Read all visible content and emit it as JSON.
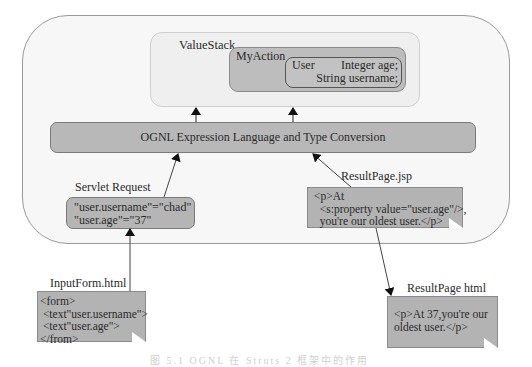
{
  "diagram": {
    "value_stack": {
      "label": "ValueStack",
      "my_action": {
        "label": "MyAction",
        "user": {
          "label": "User",
          "fields": [
            "Integer age;",
            "String username;"
          ]
        }
      }
    },
    "ognl_bar": {
      "label": "OGNL Expression Language and Type Conversion"
    },
    "servlet_request": {
      "label": "Servlet Request",
      "lines": [
        "\"user.username\"=\"chad\"",
        "\"user.age\"=\"37\""
      ]
    },
    "result_page_jsp": {
      "label": "ResultPage.jsp",
      "lines": [
        "<p>At",
        "  <s:property value=\"user.age\"/>,",
        "  you're our oldest user.</p>"
      ]
    },
    "input_form": {
      "label": "InputForm.html",
      "lines": [
        "<form>",
        " <text\"user.username\">",
        " <text\"user.age\">",
        "</from>"
      ]
    },
    "result_page_html": {
      "label": "ResultPage html",
      "lines": [
        "<p>At 37,you're our",
        "oldest user.</p>"
      ]
    },
    "caption": "图 5.1  OGNL 在 Struts 2 框架中的作用"
  }
}
